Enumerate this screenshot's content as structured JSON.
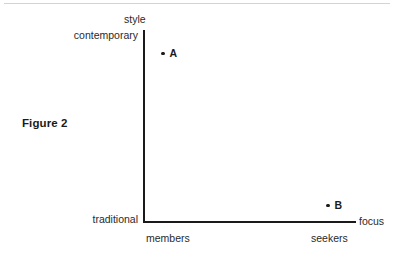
{
  "figure": {
    "caption": "Figure 2",
    "background_color": "#ffffff",
    "axis_color": "#1a1a1a",
    "rule_color": "#d3d4d6",
    "text_color": "#2a2a2a"
  },
  "chart_data": {
    "type": "scatter",
    "title": "Figure 2",
    "xlabel": "focus",
    "ylabel": "style",
    "x_tick_labels": [
      "members",
      "seekers"
    ],
    "y_tick_labels": [
      "traditional",
      "contemporary"
    ],
    "xlim": [
      "members",
      "seekers"
    ],
    "ylim": [
      "traditional",
      "contemporary"
    ],
    "grid": false,
    "legend": "none",
    "points": [
      {
        "label": "A",
        "x": 0.09,
        "y": 0.9,
        "x_desc": "members",
        "y_desc": "contemporary"
      },
      {
        "label": "B",
        "x": 0.86,
        "y": 0.09,
        "x_desc": "seekers",
        "y_desc": "traditional"
      }
    ]
  }
}
